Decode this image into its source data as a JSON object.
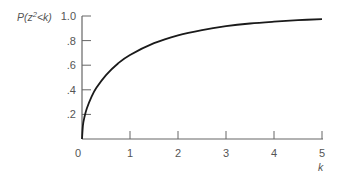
{
  "chart_data": {
    "type": "line",
    "title": "",
    "ylabel": "P(z²<k)",
    "ylabel_parts": {
      "p": "P(z",
      "sup": "2",
      "rest": "<k)"
    },
    "xlabel": "k",
    "xlim": [
      0,
      5
    ],
    "ylim": [
      0,
      1.0
    ],
    "grid": false,
    "legend": null,
    "x_ticks": [
      {
        "value": 1,
        "label": "1"
      },
      {
        "value": 2,
        "label": "2"
      },
      {
        "value": 3,
        "label": "3"
      },
      {
        "value": 4,
        "label": "4"
      },
      {
        "value": 5,
        "label": "5"
      }
    ],
    "x_origin_label": "0",
    "y_ticks": [
      {
        "value": 0.2,
        "label": ".2"
      },
      {
        "value": 0.4,
        "label": ".4"
      },
      {
        "value": 0.6,
        "label": ".6"
      },
      {
        "value": 0.8,
        "label": ".8"
      },
      {
        "value": 1.0,
        "label": "1.0"
      }
    ],
    "series": [
      {
        "name": "P(z²<k)",
        "x": [
          0,
          0.02,
          0.05,
          0.1,
          0.2,
          0.3,
          0.5,
          0.75,
          1,
          1.5,
          2,
          2.5,
          3,
          3.5,
          4,
          4.5,
          5
        ],
        "values": [
          0,
          0.112,
          0.177,
          0.248,
          0.345,
          0.416,
          0.52,
          0.614,
          0.683,
          0.779,
          0.843,
          0.886,
          0.917,
          0.939,
          0.954,
          0.966,
          0.975
        ],
        "color": "#1a1a1a"
      }
    ]
  },
  "colors": {
    "axis": "#666666",
    "curve": "#1a1a1a",
    "text": "#555555"
  }
}
